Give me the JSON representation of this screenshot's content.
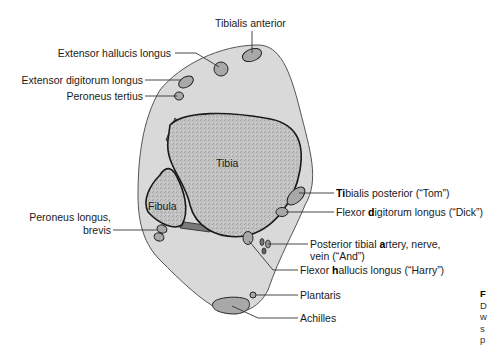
{
  "diagram": {
    "colors": {
      "soft_tissue": "#d9d9d9",
      "bone": "#bdbdbd",
      "tendon": "#a8a8a8",
      "interosseous": "#7a7a7a",
      "outline": "#222222",
      "leader_line": "#333333"
    },
    "bones": {
      "tibia": "Tibia",
      "fibula": "Fibula"
    },
    "labels": {
      "tibialis_anterior": "Tibialis anterior",
      "extensor_hallucis_longus": "Extensor hallucis longus",
      "extensor_digitorum_longus": "Extensor digitorum longus",
      "peroneus_tertius": "Peroneus tertius",
      "peroneus_longus_line1": "Peroneus longus,",
      "peroneus_longus_line2": "brevis",
      "tibialis_posterior": {
        "bold": "Ti",
        "rest": "bialis posterior (“Tom”)"
      },
      "flexor_digitorum_longus": {
        "pre": "Flexor ",
        "bold": "d",
        "rest": "igitorum longus (“Dick”)"
      },
      "posterior_tibial": {
        "pre": "Posterior tibial ",
        "bold": "a",
        "rest": "rtery, nerve,",
        "line2": "vein (“And”)"
      },
      "flexor_hallucis_longus": {
        "pre": "Flexor ",
        "bold": "h",
        "rest": "allucis longus (“Harry”)"
      },
      "plantaris": "Plantaris",
      "achilles": "Achilles"
    },
    "caption": {
      "title": "F",
      "lines": [
        "D",
        "w",
        "s",
        "p"
      ]
    }
  }
}
